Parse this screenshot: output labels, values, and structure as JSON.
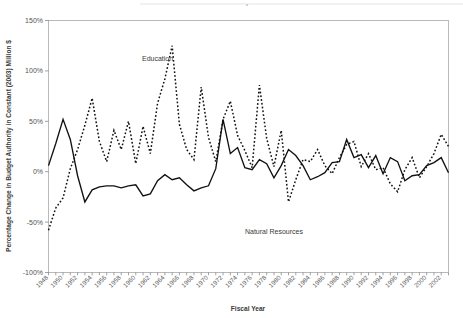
{
  "chart_data": {
    "type": "line",
    "title": "",
    "xlabel": "Fiscal Year",
    "ylabel": "Percentage Change in Budget Authority in Constant (2003) Million $",
    "ylim": [
      -100,
      150
    ],
    "ytick_values": [
      -100,
      -50,
      0,
      50,
      100,
      150
    ],
    "ytick_labels": [
      "-100%",
      "-50%",
      "0%",
      "50%",
      "100%",
      "150%"
    ],
    "xlim": [
      1948,
      2003
    ],
    "xtick_labels": [
      "1948",
      "1950",
      "1952",
      "1954",
      "1956",
      "1958",
      "1960",
      "1962",
      "1964",
      "1966",
      "1968",
      "1970",
      "1972",
      "1974",
      "1976",
      "1978",
      "1980",
      "1982",
      "1984",
      "1986",
      "1988",
      "1990",
      "1992",
      "1994",
      "1996",
      "1998",
      "2000",
      "2002"
    ],
    "xtick_step_years": 2,
    "minor_tick_step_years": 1,
    "grid": false,
    "legend_position": "inline-annotations",
    "x": [
      1948,
      1949,
      1950,
      1951,
      1952,
      1953,
      1954,
      1955,
      1956,
      1957,
      1958,
      1959,
      1960,
      1961,
      1962,
      1963,
      1964,
      1965,
      1966,
      1967,
      1968,
      1969,
      1970,
      1971,
      1972,
      1973,
      1974,
      1975,
      1976,
      1977,
      1978,
      1979,
      1980,
      1981,
      1982,
      1983,
      1984,
      1985,
      1986,
      1987,
      1988,
      1989,
      1990,
      1991,
      1992,
      1993,
      1994,
      1995,
      1996,
      1997,
      1998,
      1999,
      2000,
      2001,
      2002,
      2003
    ],
    "series": [
      {
        "name": "Education",
        "style": "dashed",
        "annotation": "Education",
        "annotation_x": 1963,
        "annotation_y": 110,
        "values": [
          -58,
          -36,
          -26,
          3,
          22,
          46,
          73,
          30,
          10,
          41,
          22,
          50,
          8,
          45,
          18,
          68,
          92,
          125,
          47,
          22,
          12,
          84,
          34,
          10,
          52,
          70,
          36,
          21,
          4,
          86,
          33,
          5,
          41,
          -30,
          -8,
          12,
          10,
          22,
          6,
          -2,
          14,
          27,
          30,
          5,
          18,
          2,
          4,
          -12,
          -20,
          2,
          14,
          -6,
          5,
          18,
          37,
          25
        ]
      },
      {
        "name": "Natural Resources",
        "style": "solid",
        "annotation": "Natural Resources",
        "annotation_x": 1979,
        "annotation_y": -62,
        "values": [
          6,
          28,
          52,
          32,
          -4,
          -30,
          -18,
          -15,
          -14,
          -14,
          -16,
          -14,
          -13,
          -24,
          -22,
          -9,
          -3,
          -8,
          -6,
          -13,
          -19,
          -16,
          -14,
          3,
          52,
          18,
          24,
          4,
          2,
          12,
          8,
          -6,
          6,
          22,
          16,
          6,
          -8,
          -5,
          -1,
          9,
          10,
          32,
          14,
          17,
          4,
          16,
          -2,
          14,
          10,
          -9,
          -4,
          -3,
          6,
          9,
          14,
          -1
        ]
      }
    ]
  },
  "annotations": {
    "education_label": "Education",
    "natural_resources_label": "Natural Resources",
    "x_axis_title": "Fiscal Year",
    "y_axis_title": "Percentage Change in Budget Authority in Constant (2003) Million $"
  }
}
